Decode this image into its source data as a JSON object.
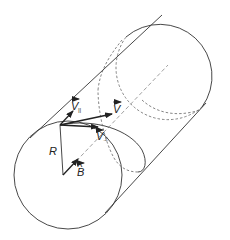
{
  "diagram": {
    "colors": {
      "line": "#333333",
      "dashed": "#666666",
      "background": "#ffffff"
    },
    "labels": {
      "v_parallel": "V",
      "v_parallel_sub": "||",
      "v": "V",
      "v_perp": "V",
      "v_perp_sub": "⊥",
      "radius": "R",
      "b_field": "B",
      "b_hat": "^"
    },
    "elements": [
      "front-circle",
      "back-circle",
      "cylinder-top-edge",
      "cylinder-bottom-edge",
      "axis-dashed",
      "helix-path",
      "velocity-vector",
      "parallel-velocity-vector",
      "perpendicular-velocity-vector",
      "radius-line",
      "b-field-unit-vector"
    ]
  }
}
